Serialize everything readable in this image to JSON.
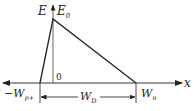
{
  "diagram": {
    "type": "electric-field-distribution-pn-junction",
    "labels": {
      "field_axis": "E",
      "peak": "E",
      "peak_sub": "0",
      "origin": "0",
      "x_axis": "x",
      "left_edge": "−W",
      "left_edge_sub": "p+",
      "depletion": "W",
      "depletion_sub": "D",
      "right_edge": "W",
      "right_edge_sub": "n"
    },
    "colors": {
      "line": "#222222",
      "axis": "#555555",
      "background": "#ffffff"
    }
  }
}
